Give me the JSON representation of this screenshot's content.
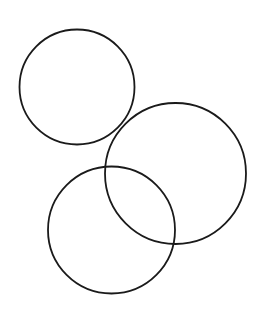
{
  "canvas": {
    "width": 256,
    "height": 311,
    "background": "#ffffff"
  },
  "style": {
    "stroke_color": "#1a1a1a",
    "stroke_width": 1.8
  },
  "circles": [
    {
      "name": "circle-top-left",
      "cx": 77,
      "cy": 87,
      "r": 57.5
    },
    {
      "name": "circle-right",
      "cx": 175.5,
      "cy": 173.5,
      "r": 70.5
    },
    {
      "name": "circle-bottom",
      "cx": 111.5,
      "cy": 230,
      "r": 63.5
    }
  ]
}
